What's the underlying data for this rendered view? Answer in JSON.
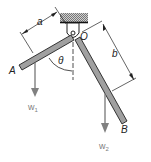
{
  "diagram": {
    "labels": {
      "a": "a",
      "b": "b",
      "O": "O",
      "theta": "θ",
      "A": "A",
      "B": "B",
      "w1": "w",
      "w1_sub": "1",
      "w2": "w",
      "w2_sub": "2"
    },
    "colors": {
      "rod_fill": "#a0a0a0",
      "rod_stroke": "#222222",
      "arrow": "#808080",
      "text": "#222222",
      "weight_text": "#808080"
    }
  }
}
